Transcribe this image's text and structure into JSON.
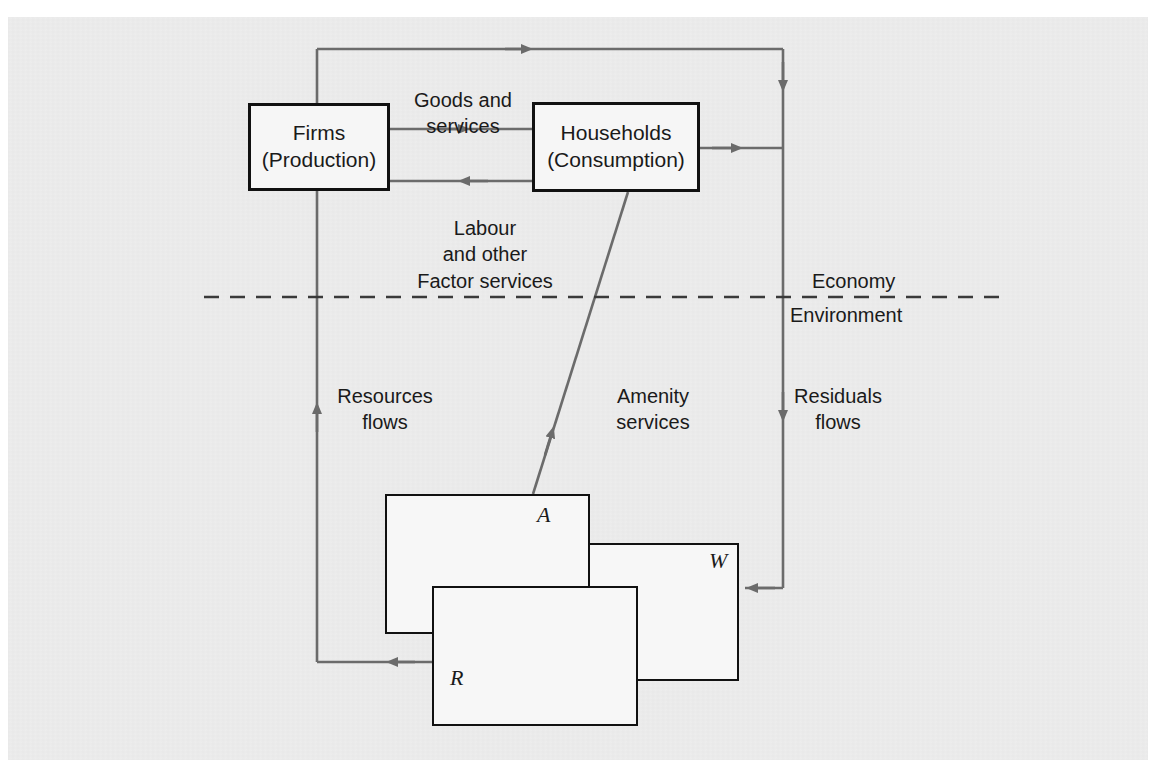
{
  "figure": {
    "kind": "economy-environment-circular-flow-diagram",
    "background_color": "#ededed",
    "page_color": "#ffffff",
    "arrow_color": "#6b6b6b",
    "box_border_color": "#111111"
  },
  "nodes": [
    {
      "id": "firms",
      "line1": "Firms",
      "line2": "(Production)"
    },
    {
      "id": "households",
      "line1": "Households",
      "line2": "(Consumption)"
    }
  ],
  "flow_labels": {
    "goods": "Goods and\nservices",
    "goods_line1": "Goods and",
    "goods_line2": "services",
    "labour_line1": "Labour",
    "labour_line2": "and other",
    "labour_line3": "Factor services",
    "resources_line1": "Resources",
    "resources_line2": "flows",
    "amenity_line1": "Amenity",
    "amenity_line2": "services",
    "residuals_line1": "Residuals",
    "residuals_line2": "flows"
  },
  "divider": {
    "above_label": "Economy",
    "below_label": "Environment",
    "style": "dashed"
  },
  "environment_boxes": [
    {
      "id": "a",
      "label": "A",
      "meaning_position": "top-left"
    },
    {
      "id": "w",
      "label": "W",
      "meaning_position": "middle-right"
    },
    {
      "id": "r",
      "label": "R",
      "meaning_position": "bottom-center"
    }
  ]
}
